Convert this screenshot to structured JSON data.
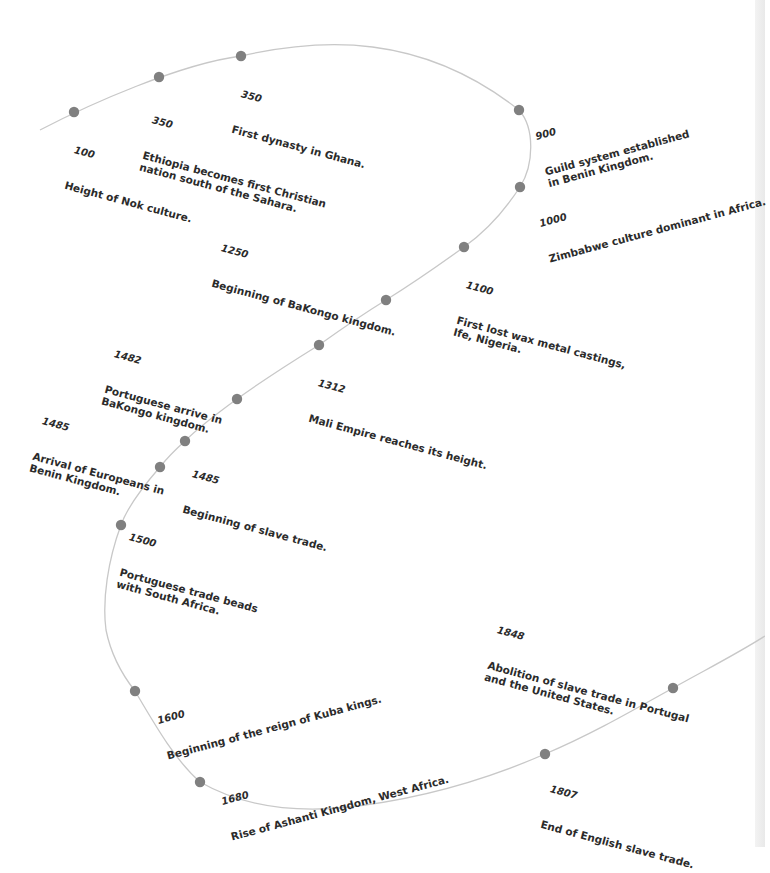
{
  "diagram": {
    "type": "timeline",
    "curve_color": "#c8c8c8",
    "dot_color": "#808080",
    "text_color": "#2b2b2b",
    "events": [
      {
        "year": "100",
        "text": "Height of Nok culture."
      },
      {
        "year": "350",
        "text": "Ethiopia becomes first Christian\nnation south of the Sahara."
      },
      {
        "year": "350",
        "text": "First dynasty in Ghana."
      },
      {
        "year": "900",
        "text": "Guild system established\nin Benin Kingdom."
      },
      {
        "year": "1000",
        "text": "Zimbabwe culture dominant in Africa."
      },
      {
        "year": "1100",
        "text": "First lost wax metal castings,\nIfe, Nigeria."
      },
      {
        "year": "1250",
        "text": "Beginning of BaKongo kingdom."
      },
      {
        "year": "1312",
        "text": "Mali Empire reaches its height."
      },
      {
        "year": "1482",
        "text": "Portuguese arrive in\nBaKongo kingdom."
      },
      {
        "year": "1485",
        "text": "Arrival of Europeans in\nBenin Kingdom."
      },
      {
        "year": "1485",
        "text": "Beginning of slave trade."
      },
      {
        "year": "1500",
        "text": "Portuguese trade beads\nwith South Africa."
      },
      {
        "year": "1600",
        "text": "Beginning of the reign of Kuba kings."
      },
      {
        "year": "1680",
        "text": "Rise of Ashanti Kingdom, West Africa."
      },
      {
        "year": "1807",
        "text": "End of English slave trade."
      },
      {
        "year": "1848",
        "text": "Abolition of slave trade in Portugal\nand the United States."
      }
    ]
  }
}
